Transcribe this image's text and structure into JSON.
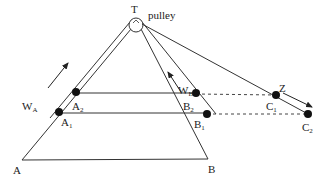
{
  "diagram": {
    "colors": {
      "line": "#333333",
      "dot": "#111111",
      "background": "#ffffff"
    },
    "labels": {
      "T": "T",
      "pulley": "pulley",
      "A": "A",
      "B": "B",
      "A1_base": "A",
      "A1_sub": "1",
      "A2_base": "A",
      "A2_sub": "2",
      "B1_base": "B",
      "B1_sub": "1",
      "B2_base": "B",
      "B2_sub": "2",
      "C1_base": "C",
      "C1_sub": "1",
      "C2_base": "C",
      "C2_sub": "2",
      "WA_base": "W",
      "WA_sub": "A",
      "WB_base": "W",
      "WB_sub": "B",
      "Z": "Z"
    },
    "points": {
      "T": [
        136,
        25
      ],
      "A": [
        22,
        160
      ],
      "B": [
        208,
        159
      ],
      "A1": [
        59,
        112
      ],
      "A2": [
        76,
        92
      ],
      "B1": [
        207,
        114
      ],
      "B2": [
        196,
        93
      ],
      "C1": [
        276,
        95
      ],
      "C2": [
        308,
        114
      ]
    }
  }
}
